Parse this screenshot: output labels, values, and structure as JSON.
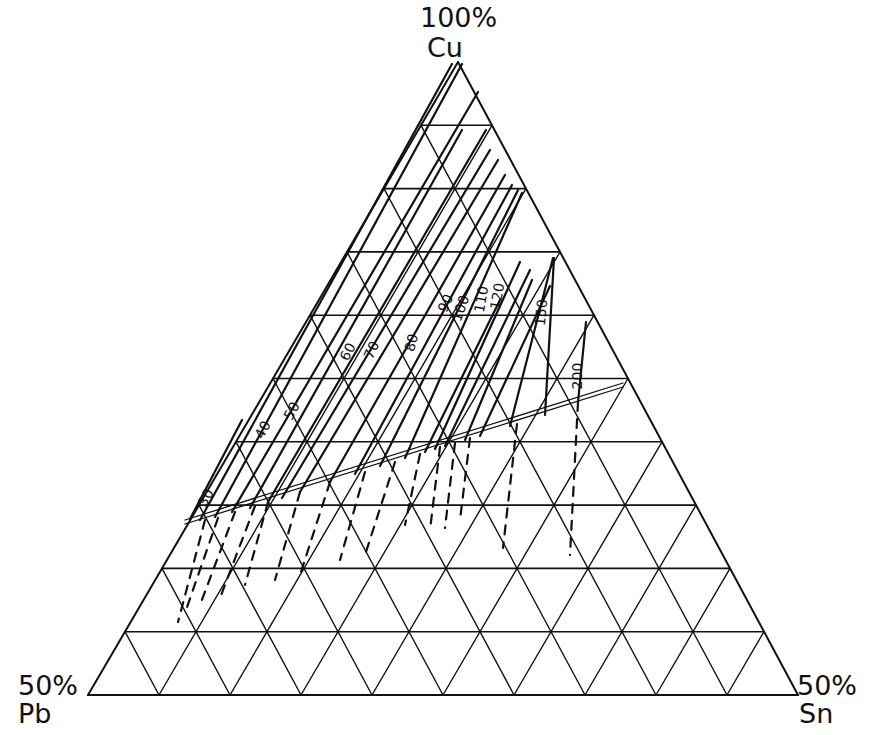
{
  "diagram": {
    "type": "ternary-phase-diagram",
    "vertices": {
      "top": {
        "percent": "100%",
        "element": "Cu"
      },
      "bottom_left": {
        "percent": "50%",
        "element": "Pb"
      },
      "bottom_right": {
        "percent": "50%",
        "element": "Sn"
      }
    },
    "grid_divisions": 10,
    "colors": {
      "line": "#111111",
      "background": "#ffffff"
    },
    "solid_isolines": [
      {
        "label": "30"
      },
      {
        "label": "40"
      },
      {
        "label": "50"
      },
      {
        "label": "60"
      },
      {
        "label": "70"
      },
      {
        "label": "80"
      },
      {
        "label": "90"
      },
      {
        "label": "100"
      },
      {
        "label": "110"
      },
      {
        "label": "120"
      },
      {
        "label": "150"
      },
      {
        "label": "200"
      }
    ],
    "boundary": "double line separating solid (upper) and dashed (lower) isolines"
  },
  "geometry": {
    "apex": [
      458,
      62
    ],
    "bl": [
      88,
      695
    ],
    "br": [
      798,
      695
    ],
    "double_line": [
      [
        185,
        522
      ],
      [
        623,
        385
      ]
    ],
    "solid_lines": [
      [
        [
          190,
          519
        ],
        [
          242,
          420
        ]
      ],
      [
        [
          200,
          520
        ],
        [
          452,
          64
        ]
      ],
      [
        [
          215,
          517
        ],
        [
          462,
          64
        ]
      ],
      [
        [
          232,
          512
        ],
        [
          478,
          92
        ]
      ],
      [
        [
          250,
          508
        ],
        [
          462,
          130
        ]
      ],
      [
        [
          268,
          502
        ],
        [
          486,
          130
        ]
      ],
      [
        [
          282,
          498
        ],
        [
          490,
          150
        ]
      ],
      [
        [
          300,
          492
        ],
        [
          498,
          160
        ]
      ],
      [
        [
          330,
          482
        ],
        [
          505,
          175
        ]
      ],
      [
        [
          355,
          474
        ],
        [
          512,
          185
        ]
      ],
      [
        [
          380,
          466
        ],
        [
          518,
          190
        ]
      ],
      [
        [
          405,
          458
        ],
        [
          522,
          193
        ]
      ],
      [
        [
          425,
          452
        ],
        [
          500,
          300
        ]
      ],
      [
        [
          435,
          449
        ],
        [
          520,
          262
        ]
      ],
      [
        [
          445,
          446
        ],
        [
          530,
          270
        ]
      ],
      [
        [
          465,
          440
        ],
        [
          532,
          280
        ]
      ],
      [
        [
          480,
          436
        ],
        [
          550,
          286
        ]
      ],
      [
        [
          510,
          426
        ],
        [
          553,
          258
        ]
      ],
      [
        [
          545,
          415
        ],
        [
          554,
          258
        ]
      ],
      [
        [
          578,
          402
        ],
        [
          586,
          322
        ]
      ]
    ],
    "dashed_lines": [
      [
        [
          205,
          520
        ],
        [
          178,
          622
        ]
      ],
      [
        [
          218,
          518
        ],
        [
          186,
          610
        ]
      ],
      [
        [
          235,
          512
        ],
        [
          200,
          605
        ]
      ],
      [
        [
          255,
          506
        ],
        [
          220,
          598
        ]
      ],
      [
        [
          268,
          502
        ],
        [
          245,
          585
        ]
      ],
      [
        [
          300,
          492
        ],
        [
          275,
          580
        ]
      ],
      [
        [
          330,
          482
        ],
        [
          300,
          575
        ]
      ],
      [
        [
          365,
          472
        ],
        [
          340,
          560
        ]
      ],
      [
        [
          395,
          462
        ],
        [
          365,
          555
        ]
      ],
      [
        [
          420,
          454
        ],
        [
          405,
          525
        ]
      ],
      [
        [
          440,
          447
        ],
        [
          430,
          530
        ]
      ],
      [
        [
          455,
          443
        ],
        [
          445,
          528
        ]
      ],
      [
        [
          470,
          438
        ],
        [
          460,
          520
        ]
      ],
      [
        [
          517,
          424
        ],
        [
          503,
          548
        ]
      ],
      [
        [
          578,
          402
        ],
        [
          570,
          555
        ]
      ]
    ],
    "labels": [
      {
        "text": "30",
        "x": 210,
        "y": 500,
        "rot": -62
      },
      {
        "text": "40",
        "x": 267,
        "y": 432,
        "rot": -62
      },
      {
        "text": "50",
        "x": 296,
        "y": 413,
        "rot": -62
      },
      {
        "text": "60",
        "x": 352,
        "y": 354,
        "rot": -62
      },
      {
        "text": "70",
        "x": 376,
        "y": 352,
        "rot": -66
      },
      {
        "text": "80",
        "x": 416,
        "y": 344,
        "rot": -75
      },
      {
        "text": "90",
        "x": 450,
        "y": 305,
        "rot": -66
      },
      {
        "text": "100",
        "x": 465,
        "y": 310,
        "rot": -70
      },
      {
        "text": "110",
        "x": 486,
        "y": 300,
        "rot": -80
      },
      {
        "text": "120",
        "x": 502,
        "y": 297,
        "rot": -80
      },
      {
        "text": "150",
        "x": 546,
        "y": 313,
        "rot": -85
      },
      {
        "text": "200",
        "x": 582,
        "y": 376,
        "rot": -90
      }
    ]
  }
}
